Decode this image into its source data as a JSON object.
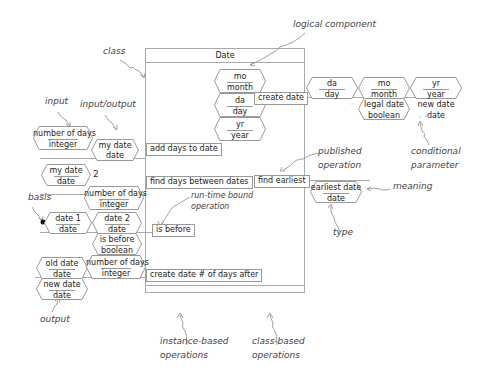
{
  "class": {
    "name": "Date",
    "components": [
      {
        "abbrev": "mo",
        "type": "month"
      },
      {
        "abbrev": "da",
        "type": "day"
      },
      {
        "abbrev": "yr",
        "type": "year"
      }
    ]
  },
  "operations": {
    "add_days": {
      "label": "add days to date",
      "params": [
        {
          "name": "number of days",
          "type": "integer"
        },
        {
          "name": "my date",
          "type": "date"
        }
      ]
    },
    "find_between": {
      "label": "find days between dates",
      "params": [
        {
          "name": "my date",
          "type": "date"
        },
        {
          "name": "number of days",
          "type": "integer"
        }
      ],
      "marker": "2"
    },
    "is_before": {
      "label": "is before",
      "params": [
        {
          "name": "date 1",
          "type": "date"
        },
        {
          "name": "date 2",
          "type": "date"
        },
        {
          "name": "is before",
          "type": "boolean"
        }
      ]
    },
    "create_after": {
      "label": "create date # of days after",
      "params": [
        {
          "name": "old date",
          "type": "date"
        },
        {
          "name": "number of days",
          "type": "integer"
        },
        {
          "name": "new date",
          "type": "date"
        }
      ]
    },
    "create_date": {
      "label": "create date",
      "params": [
        {
          "name": "da",
          "type": "day"
        },
        {
          "name": "mo",
          "type": "month"
        },
        {
          "name": "yr",
          "type": "year"
        },
        {
          "name": "legal date",
          "type": "boolean"
        },
        {
          "name": "new date",
          "type": "date"
        }
      ]
    },
    "find_earliest": {
      "label": "find earliest",
      "params": [
        {
          "name": "earliest date",
          "type": "date"
        }
      ]
    }
  },
  "annotations": {
    "logical_component": "logical component",
    "class": "class",
    "input": "input",
    "input_output": "input/output",
    "basis": "basis",
    "output": "output",
    "run_time_bound_1": "run-time bound",
    "run_time_bound_2": "operation",
    "published_1": "published",
    "published_2": "operation",
    "meaning": "meaning",
    "type": "type",
    "conditional_1": "conditional",
    "conditional_2": "parameter",
    "instance_1": "instance-based",
    "instance_2": "operations",
    "classbased_1": "class-based",
    "classbased_2": "operations"
  },
  "colors": {
    "line": "#999999",
    "arrow": "#777777",
    "text": "#222222"
  }
}
